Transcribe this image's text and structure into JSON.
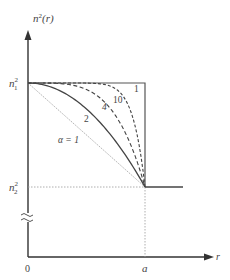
{
  "chart_data": {
    "type": "line",
    "title": "",
    "xlabel": "r",
    "ylabel": "n²(r)",
    "x_ticks": [
      "0",
      "a"
    ],
    "y_ticks": [
      "n₁²",
      "n₂²"
    ],
    "axis_break": "y",
    "grid": false,
    "legend": "inline labels",
    "series": [
      {
        "name": "α = 1",
        "label": "α = 1",
        "alpha": 1,
        "style": "dotted-gray"
      },
      {
        "name": "2",
        "label": "2",
        "alpha": 2,
        "style": "solid"
      },
      {
        "name": "4",
        "label": "4",
        "alpha": 4,
        "style": "dashed"
      },
      {
        "name": "10",
        "label": "10",
        "alpha": 10,
        "style": "dashed-short"
      },
      {
        "name": "step",
        "label": "1",
        "alpha": "∞",
        "style": "solid"
      }
    ],
    "x_range": [
      0,
      1.2
    ],
    "y_levels": {
      "n1_sq": 1,
      "n2_sq": 0
    }
  },
  "labels": {
    "ylabel_base": "n",
    "ylabel_sup": "2",
    "ylabel_tail": "(r)",
    "xlabel": "r",
    "n1_base": "n",
    "n1_sup": "2",
    "n1_sub": "1",
    "n2_base": "n",
    "n2_sup": "2",
    "n2_sub": "2",
    "origin": "0",
    "a_tick": "a",
    "alpha1": "α = 1",
    "alpha2": "2",
    "alpha4": "4",
    "alpha10": "10",
    "step": "1"
  }
}
